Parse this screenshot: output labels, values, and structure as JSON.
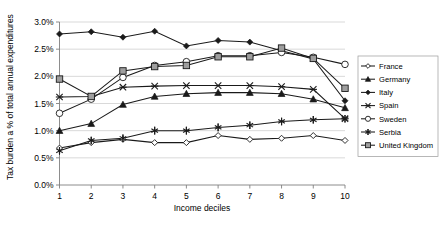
{
  "chart_data": {
    "type": "line",
    "title": "",
    "xlabel": "Income deciles",
    "ylabel": "Tax burden a % of total annual expenditures",
    "categories": [
      "1",
      "2",
      "3",
      "4",
      "5",
      "6",
      "7",
      "8",
      "9",
      "10"
    ],
    "x": [
      1,
      2,
      3,
      4,
      5,
      6,
      7,
      8,
      9,
      10
    ],
    "ylim": [
      0.0,
      3.0
    ],
    "ytick_values": [
      0.0,
      0.5,
      1.0,
      1.5,
      2.0,
      2.5,
      3.0
    ],
    "ytick_labels": [
      "0.0%",
      "0.5%",
      "1.0%",
      "1.5%",
      "2.0%",
      "2.5%",
      "3.0%"
    ],
    "xtick_labels": [
      "1",
      "2",
      "3",
      "4",
      "5",
      "6",
      "7",
      "8",
      "9",
      "10"
    ],
    "grid": true,
    "grid_axis": "y",
    "legend_position": "right",
    "series": [
      {
        "name": "France",
        "marker": "open-diamond",
        "values": [
          0.68,
          0.78,
          0.84,
          0.78,
          0.78,
          0.91,
          0.84,
          0.86,
          0.91,
          0.82
        ]
      },
      {
        "name": "Germany",
        "marker": "filled-triangle",
        "values": [
          1.0,
          1.13,
          1.48,
          1.63,
          1.68,
          1.7,
          1.7,
          1.68,
          1.58,
          1.42
        ]
      },
      {
        "name": "Italy",
        "marker": "filled-diamond",
        "values": [
          2.78,
          2.82,
          2.72,
          2.83,
          2.56,
          2.66,
          2.63,
          2.47,
          2.32,
          1.55
        ]
      },
      {
        "name": "Spain",
        "marker": "cross-x",
        "values": [
          1.62,
          1.63,
          1.8,
          1.82,
          1.83,
          1.83,
          1.83,
          1.81,
          1.76,
          1.22
        ]
      },
      {
        "name": "Sweden",
        "marker": "open-circle",
        "values": [
          1.32,
          1.58,
          1.98,
          2.2,
          2.27,
          2.38,
          2.38,
          2.44,
          2.35,
          2.22
        ]
      },
      {
        "name": "Serbia",
        "marker": "star-asterisk",
        "values": [
          0.63,
          0.82,
          0.86,
          1.0,
          1.0,
          1.06,
          1.1,
          1.17,
          1.2,
          1.22
        ]
      },
      {
        "name": "United Kingdom",
        "marker": "gray-square",
        "values": [
          1.95,
          1.63,
          2.1,
          2.18,
          2.2,
          2.36,
          2.36,
          2.52,
          2.33,
          1.78
        ]
      }
    ]
  },
  "legend": {
    "items": [
      {
        "label": "France"
      },
      {
        "label": "Germany"
      },
      {
        "label": "Italy"
      },
      {
        "label": "Spain"
      },
      {
        "label": "Sweden"
      },
      {
        "label": "Serbia"
      },
      {
        "label": "United Kingdom"
      }
    ]
  },
  "colors": {
    "line": "#1a1a1a",
    "gridline": "#c9c9c9",
    "axis": "#808080",
    "marker_gray": "#9e9e9e",
    "background": "#ffffff"
  }
}
